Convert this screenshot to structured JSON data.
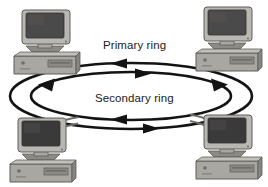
{
  "figure": {
    "background_color": "#ffffff",
    "width": 268,
    "height": 187
  },
  "rings": {
    "stroke_color": "#131313",
    "primary": {
      "label": "Primary ring",
      "position": "outer",
      "direction": "counter-clockwise",
      "arrow_count": 3
    },
    "secondary": {
      "label": "Secondary ring",
      "position": "inner",
      "direction": "clockwise",
      "arrow_count": 3
    }
  },
  "nodes": [
    {
      "id": "node-tl",
      "name": "workstation-top-left",
      "type": "desktop-computer",
      "position": "top-left"
    },
    {
      "id": "node-tr",
      "name": "workstation-top-right",
      "type": "desktop-computer",
      "position": "top-right"
    },
    {
      "id": "node-bl",
      "name": "workstation-bottom-left",
      "type": "desktop-computer",
      "position": "bottom-left"
    },
    {
      "id": "node-br",
      "name": "workstation-bottom-right",
      "type": "desktop-computer",
      "position": "bottom-right"
    }
  ],
  "palette": {
    "monitor_bezel": "#b9b7b2",
    "monitor_bezel_dark": "#8c8a85",
    "screen": "#4a4a4a",
    "screen_dark": "#3a3a3a",
    "case_top": "#c2c0bb",
    "case_front": "#a9a7a2",
    "case_side": "#87857f",
    "outline": "#5e5c57",
    "cable": "#6f6d68"
  }
}
